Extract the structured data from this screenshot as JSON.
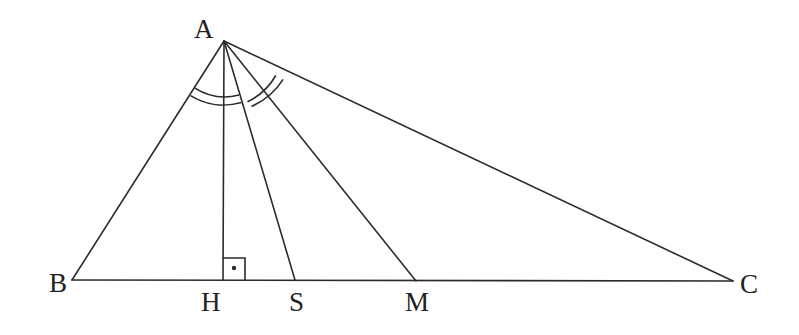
{
  "diagram": {
    "type": "geometry",
    "stroke_color": "#2b2b2b",
    "points": {
      "A": {
        "label": "A",
        "x": 224,
        "y": 41
      },
      "B": {
        "label": "B",
        "x": 72,
        "y": 280
      },
      "C": {
        "label": "C",
        "x": 733,
        "y": 281
      },
      "H": {
        "label": "H",
        "x": 223,
        "y": 280
      },
      "S": {
        "label": "S",
        "x": 295,
        "y": 280
      },
      "M": {
        "label": "M",
        "x": 416,
        "y": 281
      }
    },
    "segments": [
      {
        "name": "AB",
        "from": "A",
        "to": "B"
      },
      {
        "name": "AC",
        "from": "A",
        "to": "C"
      },
      {
        "name": "BC",
        "from": "B",
        "to": "C"
      },
      {
        "name": "AH",
        "from": "A",
        "to": "H",
        "role": "altitude"
      },
      {
        "name": "AS",
        "from": "A",
        "to": "S",
        "role": "angle-bisector"
      },
      {
        "name": "AM",
        "from": "A",
        "to": "M",
        "role": "median"
      }
    ],
    "marks": {
      "right_angle": {
        "at": "H",
        "size": 22,
        "dot": true
      },
      "equal_angles": [
        {
          "name": "angle-BAH",
          "arcs": 2
        },
        {
          "name": "angle-MAC",
          "arcs": 2
        }
      ]
    }
  }
}
